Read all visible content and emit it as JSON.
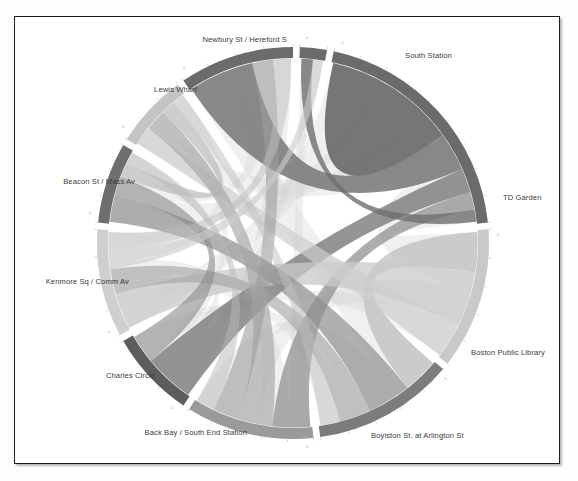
{
  "figure": {
    "title": "",
    "frame_border_color": "#1c1c1c",
    "background_color": "#ffffff"
  },
  "chart_data": {
    "type": "chord",
    "title": "",
    "subtitle": "",
    "xlabel": "",
    "ylabel": "",
    "legend_position": "none",
    "grid": false,
    "nodes": [
      {
        "id": "south_station",
        "label": "South Station",
        "color": "#6b6b6b",
        "start_angle": 0,
        "end_angle": 72,
        "value": 72,
        "label_x": 404,
        "label_y": 57,
        "label_anchor": "start"
      },
      {
        "id": "td_garden",
        "label": "TD Garden",
        "color": "#c9c9c9",
        "start_angle": 74,
        "end_angle": 116,
        "value": 42,
        "label_x": 502,
        "label_y": 199,
        "label_anchor": "start"
      },
      {
        "id": "boston_public_library",
        "label": "Boston Public Library",
        "color": "#7c7c7c",
        "start_angle": 118,
        "end_angle": 160,
        "value": 42,
        "label_x": 470,
        "label_y": 354,
        "label_anchor": "start"
      },
      {
        "id": "boylston_arlington",
        "label": "Boylston St. at Arlington St",
        "color": "#9a9a9a",
        "start_angle": 162,
        "end_angle": 200,
        "value": 38,
        "label_x": 370,
        "label_y": 437,
        "label_anchor": "start"
      },
      {
        "id": "back_bay",
        "label": "Back Bay / South End Station",
        "color": "#5d5d5d",
        "start_angle": 202,
        "end_angle": 228,
        "value": 26,
        "label_x": 246,
        "label_y": 434,
        "label_anchor": "end"
      },
      {
        "id": "charles_circle",
        "label": "Charles Circle",
        "color": "#cfcfcf",
        "start_angle": 230,
        "end_angle": 262,
        "value": 32,
        "label_x": 154,
        "label_y": 377,
        "label_anchor": "end"
      },
      {
        "id": "kenmore_comm",
        "label": "Kenmore Sq / Comm Av",
        "color": "#6e6e6e",
        "start_angle": 264,
        "end_angle": 288,
        "value": 24,
        "label_x": 128,
        "label_y": 283,
        "label_anchor": "end"
      },
      {
        "id": "beacon_mass",
        "label": "Beacon St / Mass Av",
        "color": "#c4c4c4",
        "start_angle": 290,
        "end_angle": 312,
        "value": 22,
        "label_x": 134,
        "label_y": 183,
        "label_anchor": "end"
      },
      {
        "id": "lewis_wharf",
        "label": "Lewis Wharf",
        "color": "#6b6b6b",
        "start_angle": 314,
        "end_angle": 348,
        "value": 34,
        "label_x": 196,
        "label_y": 91,
        "label_anchor": "end"
      },
      {
        "id": "newbury_hereford",
        "label": "Newbury St / Hereford S",
        "color": "#6b6b6b",
        "start_angle": 350,
        "end_angle": 358,
        "value": 8,
        "label_x": 286,
        "label_y": 41,
        "label_anchor": "end"
      }
    ],
    "links": [
      {
        "source": "south_station",
        "target": "south_station",
        "value": 38,
        "color": "#6f6f6f",
        "opacity": 0.95
      },
      {
        "source": "south_station",
        "target": "lewis_wharf",
        "value": 22,
        "color": "#767676",
        "opacity": 0.85
      },
      {
        "source": "south_station",
        "target": "back_bay",
        "value": 14,
        "color": "#7a7a7a",
        "opacity": 0.8
      },
      {
        "source": "south_station",
        "target": "boylston_arlington",
        "value": 10,
        "color": "#8a8a8a",
        "opacity": 0.7
      },
      {
        "source": "south_station",
        "target": "newbury_hereford",
        "value": 7,
        "color": "#6f6f6f",
        "opacity": 0.8
      },
      {
        "source": "td_garden",
        "target": "boston_public_library",
        "value": 9,
        "color": "#c2c2c2",
        "opacity": 0.8
      },
      {
        "source": "td_garden",
        "target": "charles_circle",
        "value": 12,
        "color": "#cacaca",
        "opacity": 0.75
      },
      {
        "source": "td_garden",
        "target": "beacon_mass",
        "value": 8,
        "color": "#cdcdcd",
        "opacity": 0.7
      },
      {
        "source": "boston_public_library",
        "target": "kenmore_comm",
        "value": 11,
        "color": "#8f8f8f",
        "opacity": 0.7
      },
      {
        "source": "boston_public_library",
        "target": "charles_circle",
        "value": 8,
        "color": "#a0a0a0",
        "opacity": 0.6
      },
      {
        "source": "boylston_arlington",
        "target": "beacon_mass",
        "value": 9,
        "color": "#a6a6a6",
        "opacity": 0.65
      },
      {
        "source": "boylston_arlington",
        "target": "lewis_wharf",
        "value": 7,
        "color": "#9c9c9c",
        "opacity": 0.6
      },
      {
        "source": "back_bay",
        "target": "kenmore_comm",
        "value": 8,
        "color": "#8b8b8b",
        "opacity": 0.6
      },
      {
        "source": "charles_circle",
        "target": "newbury_hereford",
        "value": 6,
        "color": "#cccccc",
        "opacity": 0.6
      },
      {
        "source": "kenmore_comm",
        "target": "beacon_mass",
        "value": 6,
        "color": "#b0b0b0",
        "opacity": 0.55
      },
      {
        "source": "lewis_wharf",
        "target": "charles_circle",
        "value": 6,
        "color": "#bdbdbd",
        "opacity": 0.5
      },
      {
        "source": "beacon_mass",
        "target": "boston_public_library",
        "value": 5,
        "color": "#c0c0c0",
        "opacity": 0.5
      },
      {
        "source": "kenmore_comm",
        "target": "boylston_arlington",
        "value": 5,
        "color": "#b8b8b8",
        "opacity": 0.5
      }
    ],
    "faint_links": [
      {
        "source": "south_station",
        "target": "charles_circle",
        "value": 3
      },
      {
        "source": "south_station",
        "target": "kenmore_comm",
        "value": 3
      },
      {
        "source": "south_station",
        "target": "beacon_mass",
        "value": 3
      },
      {
        "source": "south_station",
        "target": "td_garden",
        "value": 4
      },
      {
        "source": "lewis_wharf",
        "target": "boston_public_library",
        "value": 3
      },
      {
        "source": "lewis_wharf",
        "target": "kenmore_comm",
        "value": 2
      },
      {
        "source": "lewis_wharf",
        "target": "back_bay",
        "value": 2
      },
      {
        "source": "newbury_hereford",
        "target": "boylston_arlington",
        "value": 2
      },
      {
        "source": "newbury_hereford",
        "target": "back_bay",
        "value": 2
      },
      {
        "source": "charles_circle",
        "target": "boylston_arlington",
        "value": 3
      },
      {
        "source": "charles_circle",
        "target": "back_bay",
        "value": 3
      },
      {
        "source": "beacon_mass",
        "target": "back_bay",
        "value": 2
      },
      {
        "source": "kenmore_comm",
        "target": "charles_circle",
        "value": 2
      },
      {
        "source": "td_garden",
        "target": "boylston_arlington",
        "value": 3
      },
      {
        "source": "td_garden",
        "target": "back_bay",
        "value": 2
      },
      {
        "source": "boston_public_library",
        "target": "boylston_arlington",
        "value": 3
      },
      {
        "source": "boston_public_library",
        "target": "back_bay",
        "value": 2
      },
      {
        "source": "beacon_mass",
        "target": "charles_circle",
        "value": 2
      }
    ],
    "geometry": {
      "center_x": 292,
      "center_y": 242,
      "outer_radius": 196,
      "inner_radius": 185,
      "rotation_deg": -78
    },
    "axis_ticks": [
      {
        "node": "south_station",
        "label": "0"
      },
      {
        "node": "td_garden",
        "label": "0"
      },
      {
        "node": "boston_public_library",
        "label": "0"
      },
      {
        "node": "boylston_arlington",
        "label": "0"
      },
      {
        "node": "back_bay",
        "label": "0"
      },
      {
        "node": "charles_circle",
        "label": "0"
      },
      {
        "node": "kenmore_comm",
        "label": "0"
      },
      {
        "node": "beacon_mass",
        "label": "0"
      },
      {
        "node": "lewis_wharf",
        "label": "0"
      },
      {
        "node": "newbury_hereford",
        "label": "0"
      }
    ]
  }
}
